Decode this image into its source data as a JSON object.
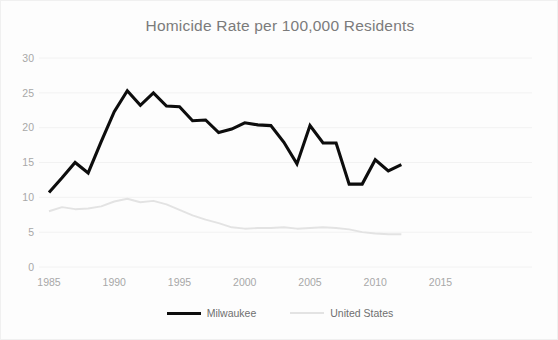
{
  "chart_data": {
    "type": "line",
    "title": "Homicide Rate per 100,000 Residents",
    "xlabel": "",
    "ylabel": "",
    "xlim": [
      1985,
      2017
    ],
    "ylim": [
      0,
      30
    ],
    "ytick_values": [
      0,
      5,
      10,
      15,
      20,
      25,
      30
    ],
    "ytick_labels": [
      "0",
      "5",
      "10",
      "15",
      "20",
      "25",
      "30"
    ],
    "xtick_values": [
      1985,
      1990,
      1995,
      2000,
      2005,
      2010,
      2015
    ],
    "xtick_labels": [
      "1985",
      "1990",
      "1995",
      "2000",
      "2005",
      "2010",
      "2015"
    ],
    "grid": true,
    "grid_axis": "y",
    "legend_position": "bottom",
    "x": [
      1985,
      1986,
      1987,
      1988,
      1989,
      1990,
      1991,
      1992,
      1993,
      1994,
      1995,
      1996,
      1997,
      1998,
      1999,
      2000,
      2001,
      2002,
      2003,
      2004,
      2005,
      2006,
      2007,
      2008,
      2009,
      2010,
      2011,
      2012
    ],
    "series": [
      {
        "name": "Milwaukee",
        "color": "#0d0d0d",
        "values": [
          10.7,
          12.8,
          15.0,
          13.5,
          18.0,
          22.3,
          25.3,
          23.2,
          25.0,
          23.1,
          23.0,
          21.0,
          21.1,
          19.3,
          19.8,
          20.7,
          20.4,
          20.3,
          17.9,
          14.8,
          20.3,
          17.8,
          17.8,
          11.9,
          11.9,
          15.4,
          13.8,
          14.7
        ]
      },
      {
        "name": "United States",
        "color": "#e3e3e3",
        "values": [
          8.0,
          8.6,
          8.3,
          8.4,
          8.7,
          9.4,
          9.8,
          9.3,
          9.5,
          9.0,
          8.2,
          7.4,
          6.8,
          6.3,
          5.7,
          5.5,
          5.6,
          5.6,
          5.7,
          5.5,
          5.6,
          5.7,
          5.6,
          5.4,
          5.0,
          4.8,
          4.7,
          4.7
        ]
      }
    ]
  },
  "legend": {
    "entries": [
      {
        "label": "Milwaukee",
        "color": "#0d0d0d"
      },
      {
        "label": "United States",
        "color": "#e3e3e3"
      }
    ]
  }
}
